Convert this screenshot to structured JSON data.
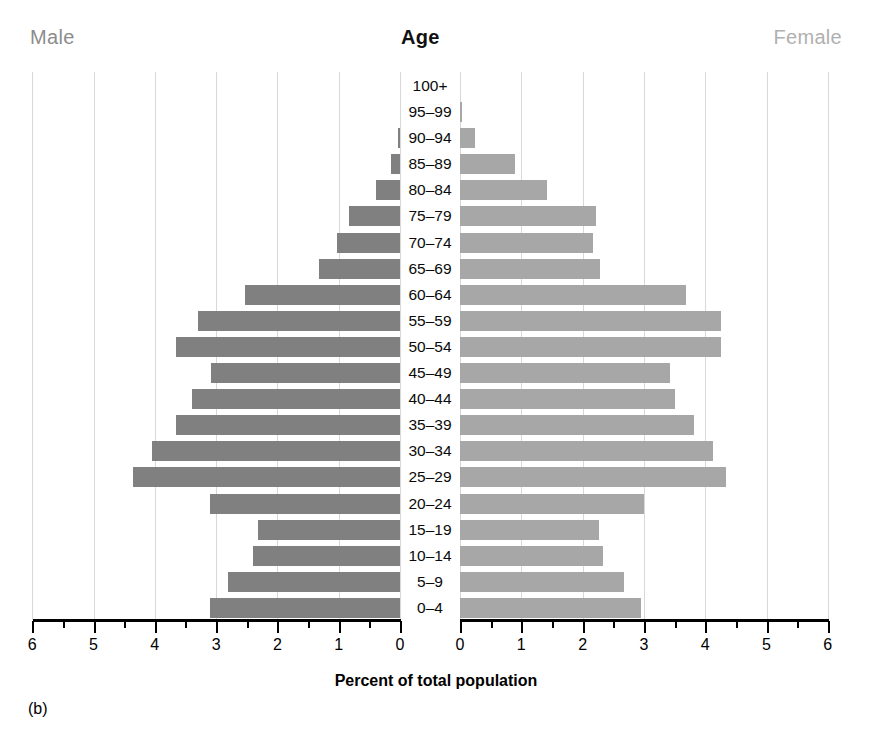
{
  "header": {
    "male_label": "Male",
    "age_label": "Age",
    "female_label": "Female"
  },
  "axis": {
    "title": "Percent of total population",
    "left_ticks": [
      "6",
      "5",
      "4",
      "3",
      "2",
      "1",
      "0"
    ],
    "right_ticks": [
      "0",
      "1",
      "2",
      "3",
      "4",
      "5",
      "6"
    ]
  },
  "panel_label": "(b)",
  "colors": {
    "male_bar": "#808080",
    "female_bar": "#a7a7a7",
    "gridline": "#d8d8d8",
    "axis": "#000000",
    "male_header": "#8c8c8c",
    "female_header": "#b0b0b0",
    "age_header": "#111111"
  },
  "chart_data": {
    "type": "bar",
    "subtype": "population-pyramid",
    "title": "",
    "xlabel": "Percent of total population",
    "ylabel": "Age",
    "xlim": [
      0,
      6
    ],
    "grid": true,
    "grid_axis": "x",
    "legend": "none",
    "categories": [
      "100+",
      "95–99",
      "90–94",
      "85–89",
      "80–84",
      "75–79",
      "70–74",
      "65–69",
      "60–64",
      "55–59",
      "50–54",
      "45–49",
      "40–44",
      "35–39",
      "30–34",
      "25–29",
      "20–24",
      "15–19",
      "10–14",
      "5–9",
      "0–4"
    ],
    "series": [
      {
        "name": "Male",
        "side": "left",
        "color": "#808080",
        "values": [
          0.0,
          0.0,
          0.04,
          0.14,
          0.39,
          0.84,
          1.03,
          1.32,
          2.53,
          3.3,
          3.65,
          3.09,
          3.39,
          3.66,
          4.05,
          4.36,
          3.1,
          2.31,
          2.39,
          2.8,
          3.1
        ]
      },
      {
        "name": "Female",
        "side": "right",
        "color": "#a7a7a7",
        "values": [
          0.0,
          0.03,
          0.25,
          0.89,
          1.42,
          2.22,
          2.17,
          2.28,
          3.69,
          4.25,
          4.26,
          3.42,
          3.51,
          3.82,
          4.12,
          4.34,
          3.0,
          2.26,
          2.33,
          2.67,
          2.96
        ]
      }
    ]
  }
}
